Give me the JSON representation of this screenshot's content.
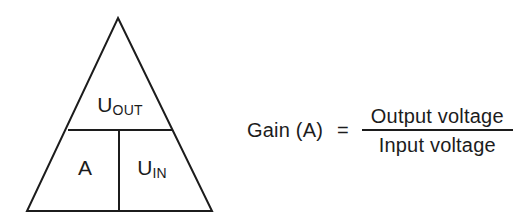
{
  "figure": {
    "type": "formula-triangle-diagram",
    "topic": "Gain (A) relationship between output and input voltage",
    "stroke_color": "#1c1c1c",
    "background_color": "#ffffff"
  },
  "triangle": {
    "name": "gain-formula-triangle",
    "top_cell": {
      "base": "U",
      "subscript": "OUT",
      "full": "U_OUT",
      "meaning": "Output voltage"
    },
    "bottom_left_cell": {
      "base": "A",
      "subscript": "",
      "full": "A",
      "meaning": "Gain"
    },
    "bottom_right_cell": {
      "base": "U",
      "subscript": "IN",
      "full": "U_IN",
      "meaning": "Input voltage"
    }
  },
  "equation": {
    "left_term": "Gain (A)",
    "operator": "=",
    "numerator": "Output voltage",
    "denominator": "Input voltage"
  }
}
